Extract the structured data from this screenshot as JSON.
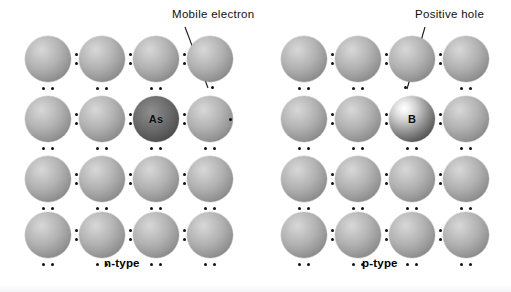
{
  "figure": {
    "title": "",
    "background_color": "#ffffff",
    "width": 511,
    "height": 292
  },
  "panels": [
    {
      "id": "n-type",
      "caption": "n-type",
      "caption_x": 104,
      "caption_y": 259,
      "annotation": {
        "label": "Mobile electron",
        "text_x": 172,
        "text_y": 10,
        "leader_from": [
          184,
          28
        ],
        "leader_to": [
          207,
          88
        ]
      },
      "dopant": {
        "symbol": "As",
        "row": 2,
        "col": 3,
        "kind": "donor"
      },
      "free_carrier": {
        "kind": "electron",
        "symbol": "•",
        "positions": [
          [
            211,
            86
          ],
          [
            229,
            118
          ]
        ]
      }
    },
    {
      "id": "p-type",
      "caption": "p-type",
      "caption_x": 362,
      "caption_y": 259,
      "annotation": {
        "label": "Positive hole",
        "text_x": 415,
        "text_y": 10,
        "leader_from": [
          424,
          28
        ],
        "leader_to": [
          408,
          88
        ]
      },
      "dopant": {
        "symbol": "B",
        "row": 2,
        "col": 3,
        "kind": "acceptor"
      },
      "free_carrier": {
        "kind": "hole",
        "symbol": "•",
        "positions": [
          [
            404,
            86
          ]
        ]
      }
    }
  ],
  "lattice": {
    "rows": 4,
    "cols": 4,
    "atom_diameter": 46,
    "col_x": [
      25,
      79,
      133,
      187
    ],
    "row_y": [
      36,
      96,
      156,
      212
    ],
    "panel_offsets": [
      0,
      256
    ],
    "bond_pair_symbol": ":",
    "lone_pair_symbol": "..",
    "atom_color": "#a8a8a8",
    "dopant_as_color": "#4d4d4d",
    "dopant_b_color": "#3f3f3f",
    "dot_color": "#111111"
  },
  "colors": {
    "background": "#ffffff",
    "text": "#101010",
    "leader_line": "#1a1a1a"
  }
}
